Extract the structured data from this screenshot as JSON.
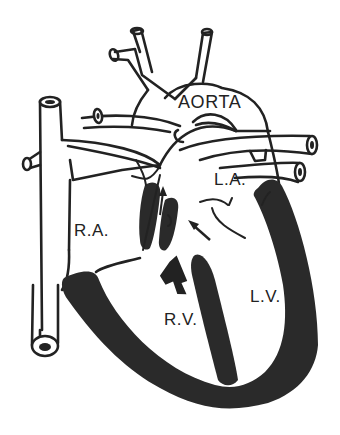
{
  "diagram": {
    "colors": {
      "stroke": "#222222",
      "muscle_fill": "#2a2a2a",
      "background": "#ffffff"
    },
    "labels": {
      "aorta": "AORTA",
      "left_atrium": "L.A.",
      "right_atrium": "R.A.",
      "right_ventricle": "R.V.",
      "left_ventricle": "L.V."
    },
    "arrows": [
      {
        "name": "thin-arrow-up-into-pulmonary",
        "style": "thin"
      },
      {
        "name": "thin-arrow-toward-septal-defect",
        "style": "thin"
      },
      {
        "name": "bold-arrow-up-from-right-ventricle",
        "style": "bold"
      }
    ]
  }
}
